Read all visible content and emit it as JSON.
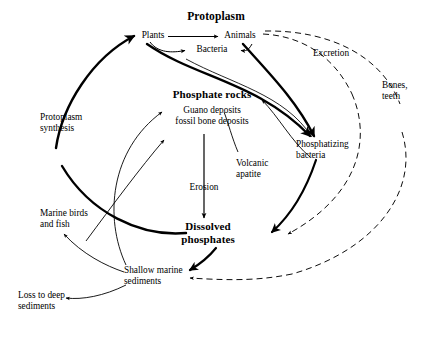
{
  "diagram": {
    "type": "cycle-flow-diagram",
    "background_color": "#ffffff",
    "line_color": "#000000",
    "nodes": {
      "protoplasm": {
        "label": "Protoplasm",
        "style": "heading"
      },
      "plants": {
        "label": "Plants",
        "style": "plain"
      },
      "bacteria": {
        "label": "Bacteria",
        "style": "plain"
      },
      "animals": {
        "label": "Animals",
        "style": "plain"
      },
      "excretion": {
        "label": "Excretion",
        "style": "plain"
      },
      "bones_teeth": {
        "label": "Bones,\nteeth",
        "style": "plain"
      },
      "phosphate_rocks": {
        "label": "Phosphate rocks",
        "style": "major"
      },
      "guano_deposits": {
        "label": "Guano deposits\nfossil bone deposits",
        "style": "plain"
      },
      "protoplasm_synthesis": {
        "label": "Protoplasm\nsynthesis",
        "style": "plain"
      },
      "phosphatizing_bacteria": {
        "label": "Phosphatizing\nbacteria",
        "style": "plain"
      },
      "volcanic_apatite": {
        "label": "Volcanic\napatite",
        "style": "plain"
      },
      "erosion": {
        "label": "Erosion",
        "style": "plain"
      },
      "dissolved_phosphates": {
        "label": "Dissolved\nphosphates",
        "style": "major"
      },
      "marine_birds_fish": {
        "label": "Marine birds\nand fish",
        "style": "plain"
      },
      "shallow_marine_sediments": {
        "label": "Shallow marine\nsediments",
        "style": "plain"
      },
      "loss_deep_sediments": {
        "label": "Loss to deep\nsediments",
        "style": "plain"
      }
    },
    "edges": [
      {
        "from": "plants",
        "to": "animals",
        "style": "solid-thin"
      },
      {
        "from": "plants",
        "to": "bacteria",
        "style": "solid-thin"
      },
      {
        "from": "animals",
        "to": "bacteria",
        "style": "solid-thin"
      },
      {
        "from": "protoplasm_synthesis",
        "to": "plants",
        "style": "solid-thick"
      },
      {
        "from": "plants",
        "to": "phosphatizing_bacteria",
        "style": "solid-thick"
      },
      {
        "from": "animals",
        "to": "phosphatizing_bacteria",
        "style": "solid-thick"
      },
      {
        "from": "bacteria",
        "to": "phosphatizing_bacteria",
        "style": "solid-thin"
      },
      {
        "from": "animals",
        "to": "excretion",
        "style": "dashed"
      },
      {
        "from": "excretion",
        "to": "dissolved_phosphates",
        "style": "dashed"
      },
      {
        "from": "animals",
        "to": "bones_teeth",
        "style": "dashed"
      },
      {
        "from": "bones_teeth",
        "to": "shallow_marine_sediments",
        "style": "dashed"
      },
      {
        "from": "phosphatizing_bacteria",
        "to": "dissolved_phosphates",
        "style": "solid-thick"
      },
      {
        "from": "phosphatizing_bacteria",
        "to": "phosphate_rocks",
        "style": "solid-thin"
      },
      {
        "from": "volcanic_apatite",
        "to": "guano_deposits",
        "style": "solid-thin"
      },
      {
        "from": "guano_deposits",
        "to": "dissolved_phosphates",
        "style": "solid-thin",
        "label": "Erosion"
      },
      {
        "from": "marine_birds_fish",
        "to": "guano_deposits",
        "style": "solid-thin"
      },
      {
        "from": "dissolved_phosphates",
        "to": "protoplasm_synthesis",
        "style": "solid-thick"
      },
      {
        "from": "dissolved_phosphates",
        "to": "shallow_marine_sediments",
        "style": "solid-thick"
      },
      {
        "from": "shallow_marine_sediments",
        "to": "marine_birds_fish",
        "style": "solid-thin"
      },
      {
        "from": "shallow_marine_sediments",
        "to": "loss_deep_sediments",
        "style": "solid-thin"
      },
      {
        "from": "shallow_marine_sediments",
        "to": "phosphate_rocks",
        "style": "solid-thin"
      }
    ]
  }
}
